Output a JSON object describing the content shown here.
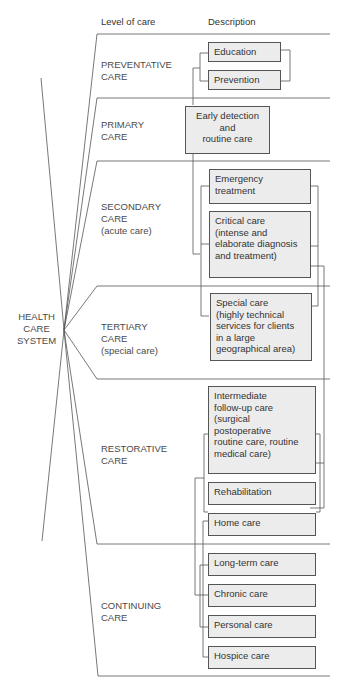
{
  "header": {
    "level_of_care": "Level of care",
    "description": "Description"
  },
  "center_label": "HEALTH\nCARE\nSYSTEM",
  "levels": [
    {
      "label": "PREVENTATIVE\nCARE",
      "descriptions": [
        "Education",
        "Prevention"
      ]
    },
    {
      "label": "PRIMARY\nCARE",
      "descriptions": [
        "Early detection\nand\nroutine care"
      ]
    },
    {
      "label": "SECONDARY\nCARE\n(acute care)",
      "descriptions": [
        "Emergency\ntreatment",
        "Critical care\n(intense and\nelaborate diagnosis\nand treatment)"
      ]
    },
    {
      "label": "TERTIARY\nCARE\n(special care)",
      "descriptions": [
        "Special care\n(highly technical\nservices for clients\nin a large\ngeographical area)"
      ]
    },
    {
      "label": "RESTORATIVE\nCARE",
      "descriptions": [
        "Intermediate\nfollow-up care\n(surgical\npostoperative\nroutine care, routine\nmedical care)",
        "Rehabilitation",
        "Home care"
      ]
    },
    {
      "label": "CONTINUING\nCARE",
      "descriptions": [
        "Long-term care",
        "Chronic care",
        "Personal care",
        "Hospice care"
      ]
    }
  ],
  "colors": {
    "box_fill": "#ececec",
    "line": "#555555",
    "text": "#3a3a3a"
  }
}
